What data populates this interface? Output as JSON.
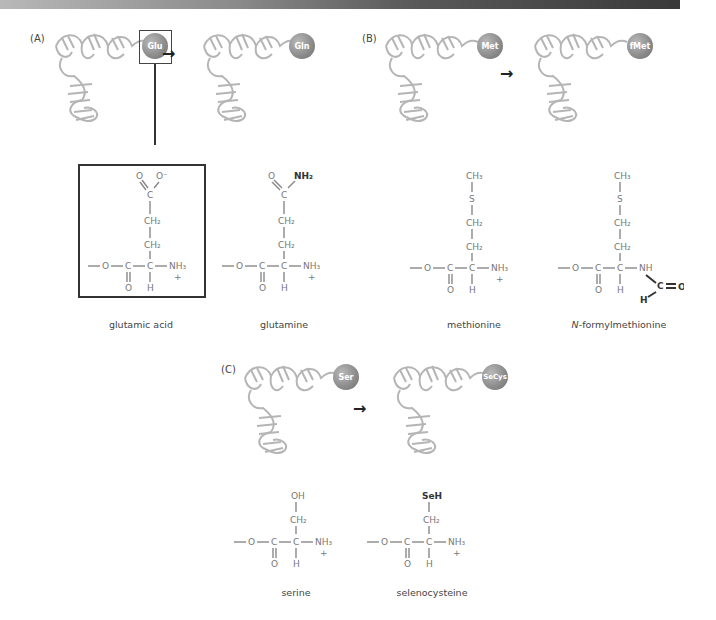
{
  "header_bar": {
    "colors": [
      "#b8b8b8",
      "#3a3a3a"
    ]
  },
  "panels": [
    {
      "label": "(A)",
      "trnas": [
        {
          "amino_acid": "Glu"
        },
        {
          "amino_acid": "Gln"
        }
      ],
      "molecules": [
        {
          "name": "glutamic acid",
          "side_chain": [
            "O",
            "O⁻",
            "C",
            "CH₂",
            "CH₂"
          ],
          "highlighted": true
        },
        {
          "name": "glutamine",
          "side_chain": [
            "O",
            "NH₂",
            "C",
            "CH₂",
            "CH₂"
          ],
          "highlighted": false
        }
      ]
    },
    {
      "label": "(B)",
      "trnas": [
        {
          "amino_acid": "Met"
        },
        {
          "amino_acid": "fMet"
        }
      ],
      "molecules": [
        {
          "name": "methionine",
          "side_chain": [
            "CH₃",
            "S",
            "CH₂",
            "CH₂"
          ]
        },
        {
          "name_prefix": "N",
          "name": "-formylmethionine",
          "side_chain": [
            "CH₃",
            "S",
            "CH₂",
            "CH₂"
          ],
          "modification": [
            "NH",
            "C",
            "O",
            "H"
          ]
        }
      ]
    },
    {
      "label": "(C)",
      "trnas": [
        {
          "amino_acid": "Ser"
        },
        {
          "amino_acid": "SeCys"
        }
      ],
      "molecules": [
        {
          "name": "serine",
          "side_chain": [
            "OH",
            "CH₂"
          ]
        },
        {
          "name": "selenocysteine",
          "side_chain": [
            "SeH",
            "CH₂"
          ]
        }
      ]
    }
  ],
  "backbone": {
    "o": "O",
    "c": "C",
    "o_dbl": "O",
    "h": "H",
    "nh3": "NH₃",
    "plus": "+"
  },
  "arrow": "→"
}
